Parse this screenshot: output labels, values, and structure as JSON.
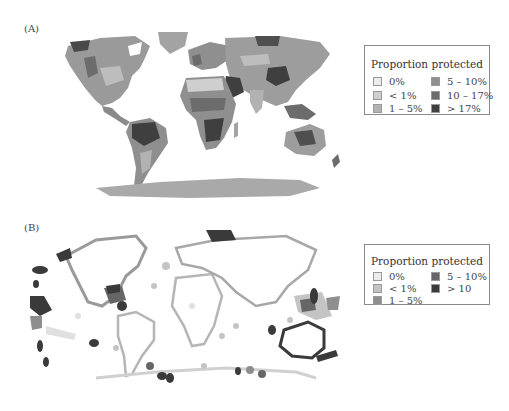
{
  "panels": [
    {
      "label": "(A)",
      "legend": {
        "title": "Proportion protected",
        "items": [
          {
            "label": "0%",
            "color": "#ececec"
          },
          {
            "label": "< 1%",
            "color": "#cfcfcf"
          },
          {
            "label": "1 – 5%",
            "color": "#b2b2b2"
          },
          {
            "label": "5 – 10%",
            "color": "#8f8f8f"
          },
          {
            "label": "10 – 17%",
            "color": "#6c6c6c"
          },
          {
            "label": "> 17%",
            "color": "#3f3f3f"
          }
        ]
      }
    },
    {
      "label": "(B)",
      "legend": {
        "title": "Proportion protected",
        "items": [
          {
            "label": "0%",
            "color": "#ececec"
          },
          {
            "label": "< 1%",
            "color": "#c4c4c4"
          },
          {
            "label": "1 – 5%",
            "color": "#8e8e8e"
          },
          {
            "label": "5 – 10%",
            "color": "#666666"
          },
          {
            "label": "> 10",
            "color": "#3a3a3a"
          }
        ]
      }
    }
  ]
}
